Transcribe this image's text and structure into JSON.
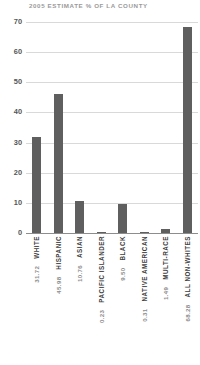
{
  "chart_data": {
    "type": "bar",
    "title": "2005 ESTIMATE % OF LA COUNTY",
    "xlabel": "",
    "ylabel": "",
    "ylim": [
      0,
      70
    ],
    "yticks": [
      0,
      10,
      20,
      30,
      40,
      50,
      60,
      70
    ],
    "grid": true,
    "legend": false,
    "bar_color": "#5f5f5f",
    "grid_color": "#d9d9d9",
    "title_color": "#9a9a9a",
    "categories": [
      "WHITE",
      "HISPANIC",
      "ASIAN",
      "PACIFIC ISLANDER",
      "BLACK",
      "NATIVE AMERICAN",
      "MULTI-RACE",
      "ALL NON-WHITES"
    ],
    "values": [
      31.72,
      45.98,
      10.76,
      0.23,
      9.5,
      0.31,
      1.49,
      68.28
    ],
    "value_labels": [
      "31.72",
      "45.98",
      "10.76",
      "0.23",
      "9.50",
      "0.31",
      "1.49",
      "68.28"
    ]
  }
}
